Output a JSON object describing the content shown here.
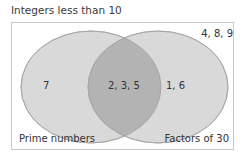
{
  "diagram": {
    "type": "venn",
    "universal_set_label": "Integers less than 10",
    "outside_elements": "4, 8, 9",
    "sets": [
      {
        "name": "Prime numbers",
        "only_elements": "7"
      },
      {
        "name": "Factors of 30",
        "only_elements": "1, 6"
      }
    ],
    "intersection_elements": "2, 3, 5",
    "colors": {
      "circle_fill": "#d9d9d9",
      "intersection_fill": "#b3b3b3",
      "stroke": "#a9a9a9",
      "box_border": "#c8c8c8"
    }
  }
}
